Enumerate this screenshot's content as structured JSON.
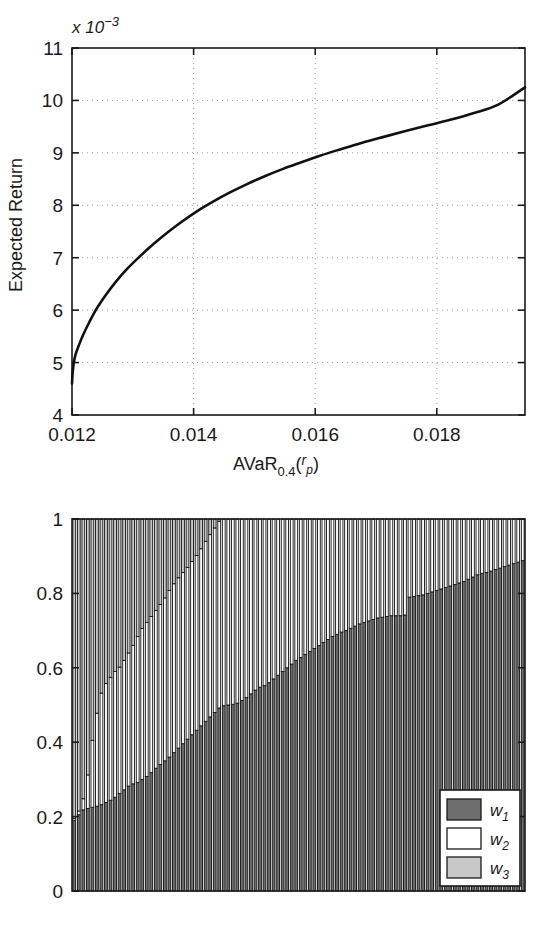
{
  "figure": {
    "panels": [
      "efficient-frontier",
      "portfolio-weights"
    ]
  },
  "top_chart": {
    "ylabel": "Expected Return",
    "xlabel": "AVaR",
    "xlabel_sub": "0.4",
    "xlabel_arg_open": "(",
    "xlabel_arg": "r",
    "xlabel_arg_sub": "p",
    "xlabel_arg_close": ")",
    "exponent_prefix": "x 10",
    "exponent_power": "−3",
    "yticks": [
      "4",
      "5",
      "6",
      "7",
      "8",
      "9",
      "10",
      "11"
    ],
    "xticks": [
      "0.012",
      "0.014",
      "0.016",
      "0.018"
    ]
  },
  "bottom_chart": {
    "yticks": [
      "0",
      "0.2",
      "0.4",
      "0.6",
      "0.8",
      "1"
    ],
    "legend": [
      {
        "label": "w",
        "sub": "1",
        "color": "#6e6e6e"
      },
      {
        "label": "w",
        "sub": "2",
        "color": "#ffffff"
      },
      {
        "label": "w",
        "sub": "3",
        "color": "#c8c8c8"
      }
    ]
  },
  "chart_data": [
    {
      "type": "line",
      "id": "efficient-frontier",
      "title": "",
      "xlabel": "AVaR_0.4(r_p)",
      "ylabel": "Expected Return",
      "y_exponent": -3,
      "xlim": [
        0.012,
        0.01945
      ],
      "ylim": [
        4,
        11
      ],
      "xticks": [
        0.012,
        0.014,
        0.016,
        0.018
      ],
      "yticks": [
        4,
        5,
        6,
        7,
        8,
        9,
        10,
        11
      ],
      "grid": true,
      "legend": "none",
      "x": [
        0.012,
        0.01201,
        0.01203,
        0.01206,
        0.01211,
        0.01218,
        0.01228,
        0.0124,
        0.01255,
        0.01272,
        0.01291,
        0.01312,
        0.01334,
        0.01357,
        0.01381,
        0.01406,
        0.01432,
        0.01459,
        0.01487,
        0.01516,
        0.01546,
        0.01577,
        0.01609,
        0.01642,
        0.01676,
        0.01711,
        0.01747,
        0.01784,
        0.01822,
        0.01861,
        0.01901,
        0.01945
      ],
      "y": [
        4.6,
        4.8,
        5.0,
        5.16,
        5.32,
        5.52,
        5.76,
        6.02,
        6.28,
        6.54,
        6.79,
        7.03,
        7.26,
        7.48,
        7.69,
        7.89,
        8.07,
        8.24,
        8.4,
        8.55,
        8.69,
        8.82,
        8.95,
        9.07,
        9.19,
        9.3,
        9.41,
        9.52,
        9.63,
        9.76,
        9.92,
        10.25
      ]
    },
    {
      "type": "bar",
      "id": "portfolio-weights",
      "stacked": true,
      "title": "",
      "xlabel": "",
      "ylabel": "",
      "ylim": [
        0,
        1
      ],
      "yticks": [
        0,
        0.2,
        0.4,
        0.6,
        0.8,
        1
      ],
      "n_bars": 100,
      "grid": false,
      "legend": "lower-right",
      "series": [
        {
          "name": "w1",
          "color": "#6e6e6e",
          "values": [
            0.19,
            0.205,
            0.218,
            0.222,
            0.225,
            0.228,
            0.232,
            0.238,
            0.244,
            0.252,
            0.262,
            0.272,
            0.282,
            0.288,
            0.292,
            0.3,
            0.308,
            0.318,
            0.33,
            0.34,
            0.35,
            0.36,
            0.372,
            0.384,
            0.396,
            0.408,
            0.42,
            0.432,
            0.444,
            0.456,
            0.468,
            0.48,
            0.492,
            0.498,
            0.5,
            0.502,
            0.505,
            0.512,
            0.52,
            0.53,
            0.54,
            0.548,
            0.552,
            0.56,
            0.57,
            0.58,
            0.59,
            0.6,
            0.61,
            0.62,
            0.628,
            0.636,
            0.644,
            0.652,
            0.66,
            0.668,
            0.676,
            0.684,
            0.69,
            0.696,
            0.7,
            0.706,
            0.712,
            0.718,
            0.722,
            0.726,
            0.73,
            0.734,
            0.736,
            0.738,
            0.74,
            0.74,
            0.74,
            0.742,
            0.79,
            0.792,
            0.794,
            0.796,
            0.8,
            0.804,
            0.808,
            0.812,
            0.816,
            0.82,
            0.824,
            0.828,
            0.832,
            0.838,
            0.844,
            0.85,
            0.854,
            0.856,
            0.86,
            0.864,
            0.868,
            0.872,
            0.876,
            0.88,
            0.884,
            0.888
          ]
        },
        {
          "name": "w2",
          "color": "#ffffff",
          "values": [
            0.005,
            0.01,
            0.03,
            0.09,
            0.18,
            0.25,
            0.3,
            0.32,
            0.33,
            0.338,
            0.34,
            0.348,
            0.358,
            0.372,
            0.392,
            0.406,
            0.414,
            0.42,
            0.424,
            0.43,
            0.438,
            0.448,
            0.454,
            0.458,
            0.46,
            0.462,
            0.466,
            0.47,
            0.476,
            0.484,
            0.49,
            0.496,
            0.502,
            0.502,
            0.5,
            0.498,
            0.495,
            0.488,
            0.48,
            0.47,
            0.46,
            0.452,
            0.448,
            0.44,
            0.43,
            0.42,
            0.41,
            0.4,
            0.39,
            0.38,
            0.372,
            0.364,
            0.356,
            0.348,
            0.34,
            0.332,
            0.324,
            0.316,
            0.31,
            0.304,
            0.3,
            0.294,
            0.288,
            0.282,
            0.278,
            0.274,
            0.27,
            0.266,
            0.264,
            0.262,
            0.26,
            0.26,
            0.26,
            0.258,
            0.21,
            0.208,
            0.206,
            0.204,
            0.2,
            0.196,
            0.192,
            0.188,
            0.184,
            0.18,
            0.176,
            0.172,
            0.168,
            0.162,
            0.156,
            0.15,
            0.146,
            0.144,
            0.14,
            0.136,
            0.132,
            0.128,
            0.124,
            0.12,
            0.116,
            0.112
          ]
        },
        {
          "name": "w3",
          "color": "#c8c8c8",
          "values": [
            0.805,
            0.785,
            0.752,
            0.688,
            0.595,
            0.522,
            0.468,
            0.442,
            0.426,
            0.41,
            0.398,
            0.38,
            0.36,
            0.34,
            0.316,
            0.294,
            0.278,
            0.262,
            0.246,
            0.23,
            0.212,
            0.192,
            0.174,
            0.158,
            0.144,
            0.13,
            0.114,
            0.098,
            0.08,
            0.06,
            0.042,
            0.024,
            0.006,
            0.0,
            0.0,
            0.0,
            0.0,
            0.0,
            0.0,
            0.0,
            0.0,
            0.0,
            0.0,
            0.0,
            0.0,
            0.0,
            0.0,
            0.0,
            0.0,
            0.0,
            0.0,
            0.0,
            0.0,
            0.0,
            0.0,
            0.0,
            0.0,
            0.0,
            0.0,
            0.0,
            0.0,
            0.0,
            0.0,
            0.0,
            0.0,
            0.0,
            0.0,
            0.0,
            0.0,
            0.0,
            0.0,
            0.0,
            0.0,
            0.0,
            0.0,
            0.0,
            0.0,
            0.0,
            0.0,
            0.0,
            0.0,
            0.0,
            0.0,
            0.0,
            0.0,
            0.0,
            0.0,
            0.0,
            0.0,
            0.0,
            0.0,
            0.0,
            0.0,
            0.0,
            0.0,
            0.0,
            0.0,
            0.0,
            0.0,
            0.0
          ]
        }
      ]
    }
  ]
}
